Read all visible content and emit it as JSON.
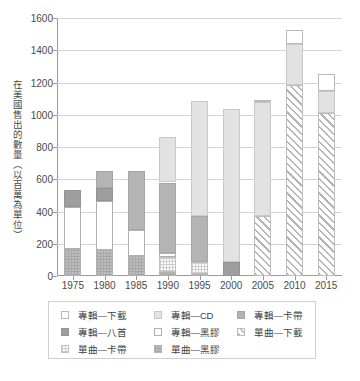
{
  "chart_data": {
    "type": "bar",
    "title": "",
    "xlabel": "",
    "ylabel": "在美國售出的數量（以百萬為單位）",
    "ylim": [
      0,
      1600
    ],
    "ytick_values": [
      0,
      200,
      400,
      600,
      800,
      1000,
      1200,
      1400,
      1600
    ],
    "ytick_labels": [
      "0",
      "200",
      "400",
      "600",
      "800",
      "1000",
      "1200",
      "1400",
      "1600"
    ],
    "grid": true,
    "stacked": true,
    "legend_position": "bottom",
    "categories": [
      "1975",
      "1980",
      "1985",
      "1990",
      "1995",
      "2000",
      "2005",
      "2010",
      "2015"
    ],
    "series": [
      {
        "name": "單曲—黑膠",
        "key": "sng-vin",
        "values": [
          165,
          160,
          125,
          25,
          10,
          0,
          0,
          0,
          0
        ]
      },
      {
        "name": "單曲—卡帶",
        "key": "sng-cas",
        "values": [
          0,
          0,
          0,
          95,
          75,
          0,
          0,
          0,
          0
        ]
      },
      {
        "name": "單曲—下載",
        "key": "sng-dl",
        "values": [
          0,
          0,
          0,
          0,
          0,
          0,
          375,
          1185,
          1010
        ]
      },
      {
        "name": "專輯—黑膠",
        "key": "alb-vin",
        "values": [
          260,
          305,
          160,
          20,
          0,
          0,
          0,
          0,
          0
        ]
      },
      {
        "name": "專輯—八首",
        "key": "alb-8tr",
        "values": [
          110,
          80,
          0,
          0,
          0,
          90,
          0,
          0,
          0
        ]
      },
      {
        "name": "專輯—卡帶",
        "key": "alb-cas",
        "values": [
          0,
          105,
          365,
          440,
          285,
          0,
          0,
          0,
          0
        ]
      },
      {
        "name": "專輯—CD",
        "key": "alb-cd",
        "values": [
          0,
          0,
          0,
          285,
          715,
          945,
          705,
          255,
          135
        ]
      },
      {
        "name": "專輯—下載",
        "key": "alb-dl",
        "values": [
          0,
          0,
          0,
          0,
          0,
          0,
          10,
          85,
          105
        ]
      }
    ],
    "totals": [
      535,
      650,
      650,
      865,
      1085,
      1035,
      1090,
      1525,
      1250
    ],
    "annotations": []
  },
  "legend": {
    "rows": [
      [
        {
          "label": "專輯—下載",
          "key": "alb-dl"
        },
        {
          "label": "專輯—CD",
          "key": "alb-cd"
        },
        {
          "label": "專輯—卡帶",
          "key": "alb-cas"
        }
      ],
      [
        {
          "label": "專輯—八首",
          "key": "alb-8tr"
        },
        {
          "label": "專輯—黑膠",
          "key": "alb-vin"
        },
        {
          "label": "單曲—下載",
          "key": "sng-dl"
        }
      ],
      [
        {
          "label": "單曲—卡帶",
          "key": "sng-cas"
        },
        {
          "label": "單曲—黑膠",
          "key": "sng-vin"
        }
      ]
    ]
  },
  "colors": {
    "grid": "#d4d4d4",
    "axis": "#9a9a9a",
    "text": "#3f3f3f",
    "album_download": "#ffffff",
    "album_cd": "#e2e2e2",
    "album_cassette": "#b4b4b4",
    "album_eight_track": "#9e9e9e",
    "album_vinyl": "#ffffff",
    "single_download": "#b5b5b5",
    "single_cassette": "#cdcdcd",
    "single_vinyl": "#bdbdbd"
  }
}
